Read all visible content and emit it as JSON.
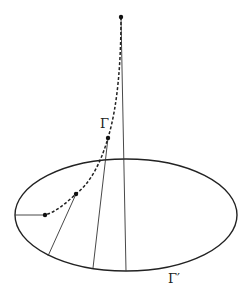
{
  "diagram": {
    "labels": {
      "curve": "Γ",
      "ellipse": "Γ′"
    },
    "colors": {
      "stroke": "#222222",
      "background": "#ffffff"
    },
    "elements": {
      "curve_style": "dashed",
      "generator_lines": 4,
      "marked_points": 4
    }
  }
}
